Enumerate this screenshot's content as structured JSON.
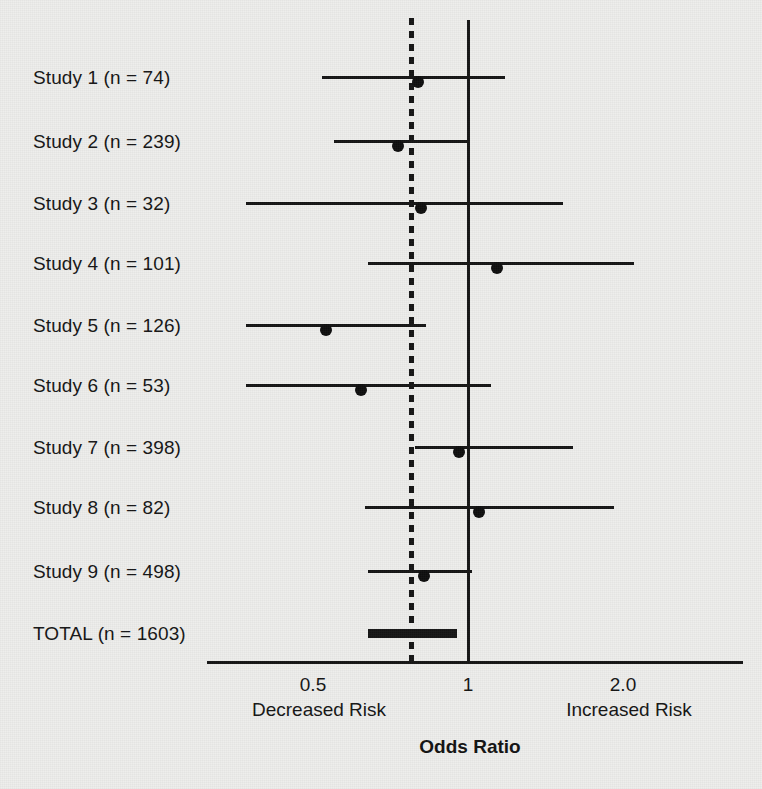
{
  "chart_data": {
    "type": "forest",
    "title": "",
    "xlabel": "Odds Ratio",
    "ylabel": "",
    "xscale": "log",
    "xlim": [
      0.33,
      2.6
    ],
    "grid": false,
    "legend": null,
    "null_line": 1,
    "pooled_line": 0.78,
    "axis_ticks": [
      {
        "value": 0.5,
        "label": "0.5"
      },
      {
        "value": 1,
        "label": "1"
      },
      {
        "value": 2.0,
        "label": "2.0"
      }
    ],
    "side_labels": {
      "left": "Decreased Risk",
      "right": "Increased Risk"
    },
    "rows": [
      {
        "label": "Study 1 (n = 74)",
        "study": "Study 1",
        "n": 74,
        "or": 0.8,
        "ci_low": 0.52,
        "ci_high": 1.18,
        "summary": false
      },
      {
        "label": "Study 2 (n = 239)",
        "study": "Study 2",
        "n": 239,
        "or": 0.73,
        "ci_low": 0.55,
        "ci_high": 1.0,
        "summary": false
      },
      {
        "label": "Study 3 (n = 32)",
        "study": "Study 3",
        "n": 32,
        "or": 0.81,
        "ci_low": 0.37,
        "ci_high": 1.53,
        "summary": false
      },
      {
        "label": "Study 4 (n = 101)",
        "study": "Study 4",
        "n": 101,
        "or": 1.14,
        "ci_low": 0.64,
        "ci_high": 2.1,
        "summary": false
      },
      {
        "label": "Study 5 (n = 126)",
        "study": "Study 5",
        "n": 126,
        "or": 0.53,
        "ci_low": 0.37,
        "ci_high": 0.83,
        "summary": false
      },
      {
        "label": "Study 6 (n = 53)",
        "study": "Study 6",
        "n": 53,
        "or": 0.62,
        "ci_low": 0.37,
        "ci_high": 1.11,
        "summary": false
      },
      {
        "label": "Study 7 (n = 398)",
        "study": "Study 7",
        "n": 398,
        "or": 0.96,
        "ci_low": 0.79,
        "ci_high": 1.6,
        "summary": false
      },
      {
        "label": "Study 8 (n = 82)",
        "study": "Study 8",
        "n": 82,
        "or": 1.05,
        "ci_low": 0.63,
        "ci_high": 1.92,
        "summary": false
      },
      {
        "label": "Study 9 (n = 498)",
        "study": "Study 9",
        "n": 498,
        "or": 0.82,
        "ci_low": 0.64,
        "ci_high": 1.02,
        "summary": false
      },
      {
        "label": "TOTAL (n = 1603)",
        "study": "TOTAL",
        "n": 1603,
        "or": 0.78,
        "ci_low": 0.64,
        "ci_high": 0.95,
        "summary": true
      }
    ]
  },
  "colors": {
    "background": "#eeeeec",
    "ink": "#141414"
  },
  "layout": {
    "label_x": 33,
    "row_y": [
      77,
      141,
      203,
      263,
      325,
      385,
      447,
      507,
      571,
      633
    ],
    "label_y": [
      68,
      132,
      194,
      254,
      316,
      376,
      438,
      498,
      562,
      624
    ],
    "axis_y": 661,
    "axis_x_start": 207,
    "axis_x_end": 743,
    "x_null_px": 468,
    "x_pooled_px": 411,
    "px_per_doubling": 155,
    "null_line_top": 20,
    "null_line_bottom": 661,
    "pooled_line_top": 18,
    "pooled_line_bottom": 661,
    "tick_label_y": 675,
    "side_label_y": 700,
    "axis_title_x": 470,
    "axis_title_y": 737
  }
}
